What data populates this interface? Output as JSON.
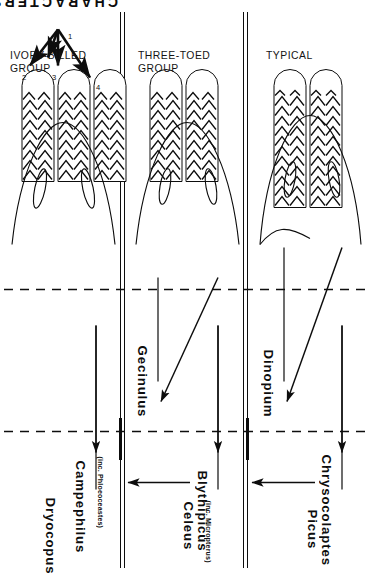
{
  "figure": {
    "title": "CHARACTERS",
    "orientation": "rotated-90-ccw",
    "ink_color": "#0d0d0d",
    "background_color": "#ffffff"
  },
  "axis_label": {
    "characters": "CHARACTERS"
  },
  "character_numbers": [
    "1",
    "2",
    "3",
    "4"
  ],
  "row_groups": [
    {
      "id": "ivory-billed",
      "line1": "IVORY-BILLED",
      "line2": "GROUP"
    },
    {
      "id": "three-toed",
      "line1": "THREE-TOED",
      "line2": "GROUP"
    },
    {
      "id": "typical",
      "line1": "TYPICAL",
      "line2": ""
    }
  ],
  "genera": [
    {
      "id": "chrysocolaptes",
      "name": "Chrysocolaptes",
      "subtitle": ""
    },
    {
      "id": "blythipicus",
      "name": "Blythipicus",
      "subtitle": ""
    },
    {
      "id": "campephilus",
      "name": "Campephilus",
      "subtitle": "(inc. Phloeoceastes)"
    },
    {
      "id": "dinopium",
      "name": "Dinopium",
      "subtitle": ""
    },
    {
      "id": "gecinulus",
      "name": "Gecinulus",
      "subtitle": ""
    },
    {
      "id": "picus",
      "name": "Picus",
      "subtitle": ""
    },
    {
      "id": "celeus",
      "name": "Celeus",
      "subtitle": "(inc. Micropterus)"
    },
    {
      "id": "dryocopus",
      "name": "Dryocopus",
      "subtitle": ""
    }
  ],
  "derivation_arrows": [
    {
      "from": "Picus",
      "to": "Dinopium"
    },
    {
      "from": "Picus",
      "to": "Chrysocolaptes"
    },
    {
      "from": "Celeus",
      "to": "Gecinulus"
    },
    {
      "from": "Celeus",
      "to": "Blythipicus"
    },
    {
      "from": "Celeus",
      "to": "Dryocopus"
    },
    {
      "from": "Celeus",
      "to": "Campephilus"
    }
  ],
  "character_panels": [
    {
      "group": "ivory-billed",
      "tail_feather_tips": 3,
      "bill_outline": "broad",
      "nostril_ovals": 2
    },
    {
      "group": "three-toed",
      "tail_feather_tips": 2,
      "bill_outline": "broad",
      "nostril_ovals": 2
    },
    {
      "group": "typical",
      "tail_feather_tips": 2,
      "bill_outline": "pointed",
      "nostril_ovals": 2
    }
  ]
}
